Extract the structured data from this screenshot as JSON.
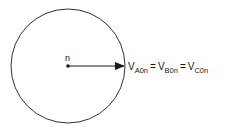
{
  "diagram": {
    "center_label": "n",
    "equation": {
      "terms": [
        {
          "main": "V",
          "sub": "A0n"
        },
        {
          "main": "V",
          "sub": "B0n"
        },
        {
          "main": "V",
          "sub": "C0n"
        }
      ],
      "operator": "="
    },
    "colors": {
      "stroke": "#333333",
      "text": "#1a1a1a",
      "background": "#ffffff"
    }
  }
}
